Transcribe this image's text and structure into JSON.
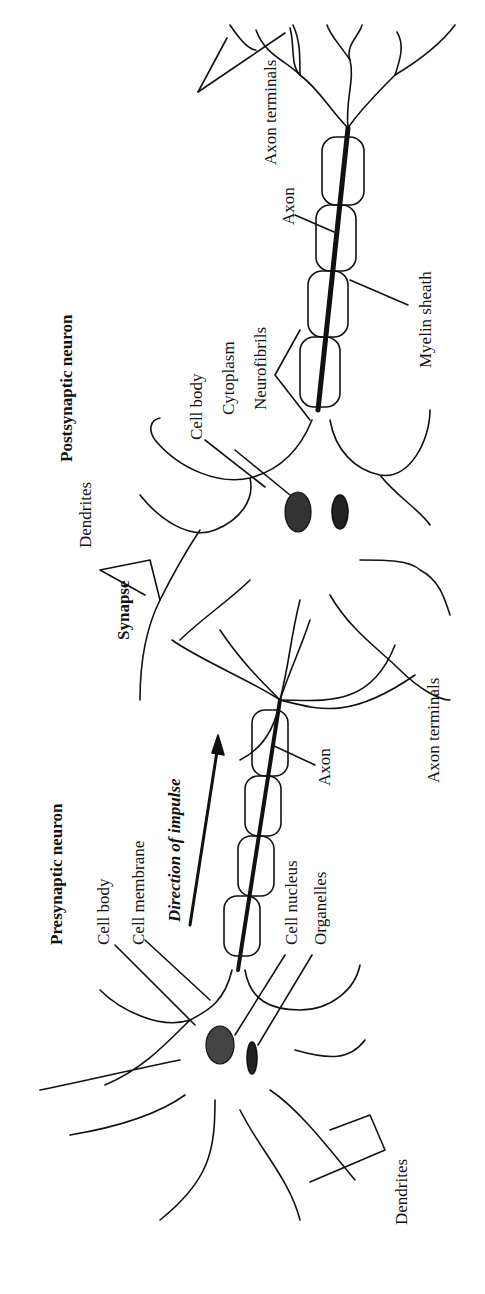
{
  "figure": {
    "orientation": "rotated 90 degrees counter-clockwise",
    "ink_color": "#111111",
    "background": "#ffffff",
    "neurons": [
      {
        "title": "Presynaptic neuron",
        "labels": [
          "Cell body",
          "Cell membrane",
          "Cell nucleus",
          "Organelles",
          "Axon",
          "Axon terminals",
          "Dendrites"
        ]
      },
      {
        "title": "Postsynaptic neuron",
        "labels": [
          "Cell body",
          "Cytoplasm",
          "Neurofibrils",
          "Axon",
          "Myelin sheath",
          "Axon terminals",
          "Dendrites"
        ]
      }
    ],
    "labels": {
      "presynaptic": "Presynaptic neuron",
      "postsynaptic": "Postsynaptic neuron",
      "synapse": "Synapse",
      "direction": "Direction of impulse",
      "pre_cell_body": "Cell body",
      "pre_cell_membrane": "Cell membrane",
      "pre_cell_nucleus": "Cell nucleus",
      "pre_organelles": "Organelles",
      "pre_axon": "Axon",
      "pre_axon_terminals": "Axon terminals",
      "pre_dendrites": "Dendrites",
      "post_cell_body": "Cell body",
      "post_cytoplasm": "Cytoplasm",
      "post_neurofibrils": "Neurofibrils",
      "post_axon": "Axon",
      "post_myelin": "Myelin sheath",
      "post_axon_terminals": "Axon terminals",
      "post_dendrites": "Dendrites"
    }
  }
}
